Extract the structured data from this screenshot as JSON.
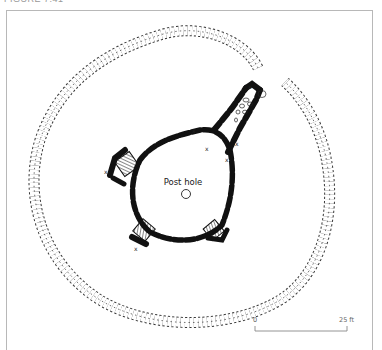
{
  "figure": {
    "caption": "FIGURE 7.41",
    "labels": {
      "post_hole": "Post hole",
      "marker": "x"
    },
    "scale_bar": {
      "start_label": "0",
      "end_label": "25 ft"
    }
  },
  "colors": {
    "frame": "#b8b8b8",
    "ink": "#111111",
    "stone_outline": "#222222"
  }
}
